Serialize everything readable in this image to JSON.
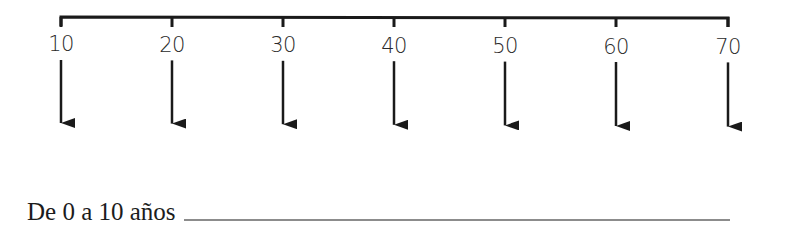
{
  "timeline": {
    "ticks": [
      {
        "label": "10",
        "x": 61
      },
      {
        "label": "20",
        "x": 172
      },
      {
        "label": "30",
        "x": 283
      },
      {
        "label": "40",
        "x": 394
      },
      {
        "label": "50",
        "x": 505
      },
      {
        "label": "60",
        "x": 616
      },
      {
        "label": "70",
        "x": 728
      }
    ],
    "line_color": "#1a1a1a"
  },
  "exercise": {
    "prompt": "De 0 a 10 años"
  }
}
